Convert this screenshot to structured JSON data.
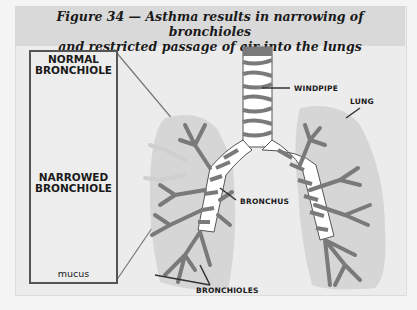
{
  "figure": {
    "title_line1": "Figure 34 — Asthma results in narrowing of bronchioles",
    "title_line2": "and restricted passage of air into the lungs"
  },
  "inset": {
    "normal_label_line1": "NORMAL",
    "normal_label_line2": "BRONCHIOLE",
    "narrowed_label_line1": "NARROWED",
    "narrowed_label_line2": "BRONCHIOLE",
    "mucus_label": "mucus"
  },
  "callouts": {
    "windpipe": "WINDPIPE",
    "lung": "LUNG",
    "bronchus": "BRONCHUS",
    "bronchioles": "BRONCHIOLES"
  },
  "colors": {
    "background": "#ececec",
    "header": "#d9d9d9",
    "lung_fill": "#d6d6d6",
    "airway_dark": "#7a7a7a",
    "airway_light": "#ffffff",
    "outline": "#333333"
  }
}
